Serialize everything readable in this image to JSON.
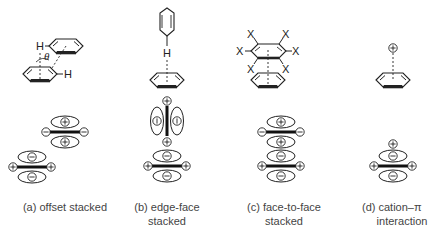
{
  "panels": [
    {
      "id": "a",
      "caption_lines": [
        "(a) offset stacked"
      ],
      "structure": "two benzene rings, offset parallel stacking with C-H...pi contacts",
      "atom_labels": [
        "H",
        "H"
      ],
      "angle_label": "θ",
      "quadrupoles": [
        {
          "ellipse_top": "⊕",
          "ends": "⊖",
          "ellipse_bottom": "⊕"
        },
        {
          "ellipse_top": "⊖",
          "ends": "⊕",
          "ellipse_bottom": "⊖"
        }
      ]
    },
    {
      "id": "b",
      "caption_lines": [
        "(b) edge-face",
        "stacked"
      ],
      "structure": "benzene ring pointing C-H edge into face of second benzene ring",
      "atom_labels": [
        "H"
      ],
      "quadrupoles": [
        {
          "orientation": "vertical",
          "ellipse_left": "⊖",
          "ellipse_right": "⊖",
          "ends": "⊕"
        },
        {
          "orientation": "horizontal",
          "ellipse_top": "⊖",
          "ends": "⊕",
          "ellipse_bottom": "⊖"
        }
      ]
    },
    {
      "id": "c",
      "caption_lines": [
        "(c) face-to-face",
        "stacked"
      ],
      "structure": "hexasubstituted (X) arene stacked face-to-face on benzene",
      "atom_labels": [
        "X",
        "X",
        "X",
        "X",
        "X",
        "X"
      ],
      "quadrupoles": [
        {
          "ellipse_top": "⊕",
          "ends": "⊖",
          "ellipse_bottom": "⊕"
        },
        {
          "ellipse_top": "⊖",
          "ends": "⊕",
          "ellipse_bottom": "⊖"
        }
      ]
    },
    {
      "id": "d",
      "caption_lines": [
        "(d) cation–π",
        "interaction"
      ],
      "structure": "cation above benzene ring face",
      "cation_label": "⊕",
      "quadrupoles": [
        {
          "cation": "⊕",
          "ellipse_top": "⊖",
          "ends": "⊕",
          "ellipse_bottom": "⊖"
        }
      ]
    }
  ],
  "symbols": {
    "plus": "⊕",
    "minus": "⊖",
    "minus_vertical": "⦶"
  },
  "colors": {
    "line": "#222222",
    "caption": "#444444",
    "background": "#ffffff"
  }
}
